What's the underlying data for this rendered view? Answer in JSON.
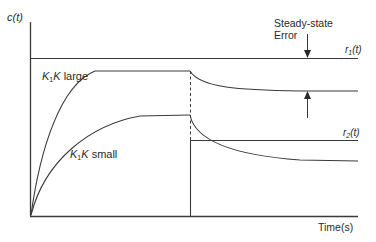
{
  "diagram": {
    "y_axis_label": "c(t)",
    "x_axis_label": "Time(s)",
    "reference_1_label": "r1(t)",
    "reference_1_parts": {
      "base": "r",
      "sub": "1",
      "arg": "(t)"
    },
    "reference_2_label": "r2(t)",
    "reference_2_parts": {
      "base": "r",
      "sub": "2",
      "arg": "(t)"
    },
    "steady_state_label_line1": "Steady-state",
    "steady_state_label_line2": "Error",
    "curve_large_label": "K1K large",
    "curve_large_parts": {
      "k": "K",
      "sub": "1",
      "k2": "K",
      "word": " large"
    },
    "curve_small_label": "K1K small",
    "curve_small_parts": {
      "k": "K",
      "sub": "1",
      "k2": "K",
      "word": " small"
    },
    "colors": {
      "line": "#3a3a3a",
      "text": "#2a2a2a",
      "background": "#ffffff"
    }
  }
}
